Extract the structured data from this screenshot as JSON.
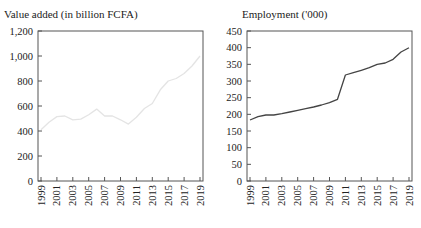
{
  "chart_data": [
    {
      "type": "line",
      "title": "Value added (in billion FCFA)",
      "xlabel": "",
      "ylabel": "",
      "x": [
        1999,
        2000,
        2001,
        2002,
        2003,
        2004,
        2005,
        2006,
        2007,
        2008,
        2009,
        2010,
        2011,
        2012,
        2013,
        2014,
        2015,
        2016,
        2017,
        2018,
        2019
      ],
      "x_tick_labels": [
        "1999",
        "2001",
        "2003",
        "2005",
        "2007",
        "2009",
        "2011",
        "2013",
        "2015",
        "2017",
        "2019"
      ],
      "y_tick_labels": [
        "0",
        "200",
        "400",
        "600",
        "800",
        "1,000",
        "1,200"
      ],
      "ylim": [
        0,
        1200
      ],
      "series": [
        {
          "name": "Value added",
          "color": "#e4e4e4",
          "values": [
            410,
            470,
            515,
            520,
            490,
            495,
            530,
            575,
            520,
            520,
            490,
            455,
            510,
            580,
            620,
            730,
            800,
            820,
            860,
            920,
            1000
          ]
        }
      ],
      "grid": false,
      "legend": null
    },
    {
      "type": "line",
      "title": "Employment ('000)",
      "xlabel": "",
      "ylabel": "",
      "x": [
        1999,
        2000,
        2001,
        2002,
        2003,
        2004,
        2005,
        2006,
        2007,
        2008,
        2009,
        2010,
        2011,
        2012,
        2013,
        2014,
        2015,
        2016,
        2017,
        2018,
        2019
      ],
      "x_tick_labels": [
        "1999",
        "2001",
        "2003",
        "2005",
        "2007",
        "2009",
        "2011",
        "2013",
        "2015",
        "2017",
        "2019"
      ],
      "y_tick_labels": [
        "0",
        "50",
        "100",
        "150",
        "200",
        "250",
        "300",
        "350",
        "400",
        "450"
      ],
      "ylim": [
        0,
        450
      ],
      "series": [
        {
          "name": "Employment",
          "color": "#444444",
          "values": [
            183,
            193,
            198,
            198,
            202,
            207,
            212,
            217,
            222,
            228,
            235,
            245,
            318,
            325,
            332,
            340,
            350,
            354,
            365,
            387,
            400
          ]
        }
      ],
      "grid": false,
      "legend": null
    }
  ],
  "left": {
    "title": "Value added (in billion FCFA)"
  },
  "right": {
    "title": "Employment ('000)"
  }
}
